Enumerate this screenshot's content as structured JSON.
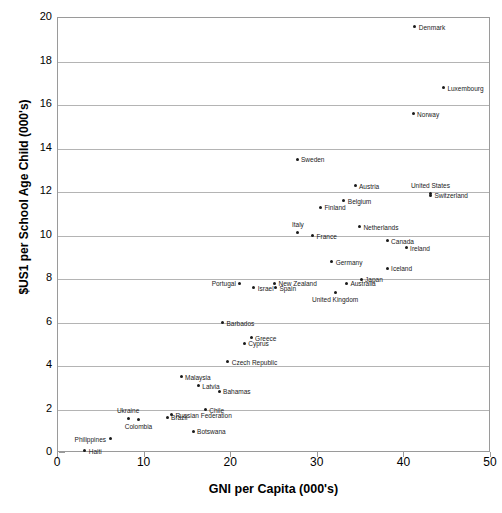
{
  "chart_data": {
    "type": "scatter",
    "title": "",
    "xlabel": "GNI per Capita (000's)",
    "ylabel": "$US1 per School Age Child (000's)",
    "xlim": [
      0,
      50
    ],
    "ylim": [
      0,
      20
    ],
    "xticks": [
      0,
      10,
      20,
      30,
      40,
      50
    ],
    "yticks": [
      0,
      2,
      4,
      6,
      8,
      10,
      12,
      14,
      16,
      18,
      20
    ],
    "grid": "horizontal",
    "legend": "none",
    "point_color": "#1a1a1a",
    "grid_color": "#b4b4b4",
    "frame_color": "#9a9a9a",
    "points": [
      {
        "label": "Denmark",
        "x": 41.2,
        "y": 19.6,
        "pos": "right"
      },
      {
        "label": "Luxembourg",
        "x": 44.5,
        "y": 16.8,
        "pos": "right"
      },
      {
        "label": "Norway",
        "x": 41.0,
        "y": 15.6,
        "pos": "right"
      },
      {
        "label": "Sweden",
        "x": 27.6,
        "y": 13.5,
        "pos": "right"
      },
      {
        "label": "Austria",
        "x": 34.3,
        "y": 12.3,
        "pos": "right"
      },
      {
        "label": "United States",
        "x": 43.0,
        "y": 11.95,
        "pos": "above"
      },
      {
        "label": "Switzerland",
        "x": 43.0,
        "y": 11.85,
        "pos": "right"
      },
      {
        "label": "Belgium",
        "x": 33.0,
        "y": 11.6,
        "pos": "right"
      },
      {
        "label": "Finland",
        "x": 30.3,
        "y": 11.3,
        "pos": "right"
      },
      {
        "label": "Netherlands",
        "x": 34.8,
        "y": 10.4,
        "pos": "right"
      },
      {
        "label": "Italy",
        "x": 27.7,
        "y": 10.15,
        "pos": "above"
      },
      {
        "label": "France",
        "x": 29.4,
        "y": 10.0,
        "pos": "right"
      },
      {
        "label": "Canada",
        "x": 38.0,
        "y": 9.75,
        "pos": "right"
      },
      {
        "label": "Ireland",
        "x": 40.2,
        "y": 9.45,
        "pos": "right"
      },
      {
        "label": "Germany",
        "x": 31.6,
        "y": 8.8,
        "pos": "right"
      },
      {
        "label": "Iceland",
        "x": 38.0,
        "y": 8.5,
        "pos": "right"
      },
      {
        "label": "Japan",
        "x": 35.0,
        "y": 8.0,
        "pos": "right"
      },
      {
        "label": "Australia",
        "x": 33.3,
        "y": 7.8,
        "pos": "right"
      },
      {
        "label": "Portugal",
        "x": 21.0,
        "y": 7.8,
        "pos": "left"
      },
      {
        "label": "New Zealand",
        "x": 25.0,
        "y": 7.8,
        "pos": "right"
      },
      {
        "label": "Israel",
        "x": 22.6,
        "y": 7.6,
        "pos": "right"
      },
      {
        "label": "Spain",
        "x": 25.1,
        "y": 7.6,
        "pos": "right"
      },
      {
        "label": "United Kingdom",
        "x": 32.0,
        "y": 7.4,
        "pos": "below"
      },
      {
        "label": "Barbados",
        "x": 19.0,
        "y": 6.0,
        "pos": "right"
      },
      {
        "label": "Greece",
        "x": 22.3,
        "y": 5.3,
        "pos": "right"
      },
      {
        "label": "Cyprus",
        "x": 21.5,
        "y": 5.05,
        "pos": "right"
      },
      {
        "label": "Czech Republic",
        "x": 19.6,
        "y": 4.2,
        "pos": "right"
      },
      {
        "label": "Malaysia",
        "x": 14.2,
        "y": 3.5,
        "pos": "right"
      },
      {
        "label": "Latvia",
        "x": 16.2,
        "y": 3.1,
        "pos": "right"
      },
      {
        "label": "Bahamas",
        "x": 18.6,
        "y": 2.85,
        "pos": "right"
      },
      {
        "label": "Chile",
        "x": 17.0,
        "y": 2.0,
        "pos": "right"
      },
      {
        "label": "Russian Federation",
        "x": 13.1,
        "y": 1.75,
        "pos": "right"
      },
      {
        "label": "Brazil",
        "x": 12.6,
        "y": 1.65,
        "pos": "right"
      },
      {
        "label": "Ukraine",
        "x": 8.1,
        "y": 1.6,
        "pos": "above"
      },
      {
        "label": "Colombia",
        "x": 9.3,
        "y": 1.55,
        "pos": "below"
      },
      {
        "label": "Botswana",
        "x": 15.6,
        "y": 1.0,
        "pos": "right"
      },
      {
        "label": "Philippines",
        "x": 6.0,
        "y": 0.65,
        "pos": "left"
      },
      {
        "label": "Haiti",
        "x": 3.1,
        "y": 0.1,
        "pos": "right"
      }
    ]
  }
}
